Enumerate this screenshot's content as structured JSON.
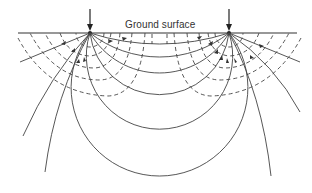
{
  "diagram": {
    "title": "",
    "labels": {
      "ground_surface": "Ground surface"
    },
    "electrodes": [
      {
        "name": "current-electrode-left",
        "x": 90,
        "y": 33,
        "arrow": "down"
      },
      {
        "name": "current-electrode-right",
        "x": 229,
        "y": 33,
        "arrow": "down"
      }
    ],
    "legend_semantics": {
      "solid_lines": "current flow lines",
      "dashed_lines": "equipotential surfaces"
    },
    "colors": {
      "line": "#444444",
      "background": "#ffffff"
    }
  }
}
